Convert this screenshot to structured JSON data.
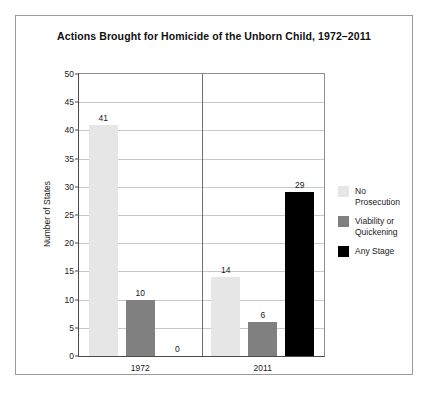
{
  "chart_data": {
    "type": "bar",
    "title": "Actions Brought for Homicide of the Unborn Child, 1972–2011",
    "xlabel": "",
    "ylabel": "Number of States",
    "categories": [
      "1972",
      "2011"
    ],
    "series": [
      {
        "name": "No Prosecution",
        "values": [
          41,
          10
        ],
        "color": "#e6e6e6"
      },
      {
        "name": "Viability or\nQuickening",
        "values": [
          10,
          6
        ],
        "color": "#808080"
      },
      {
        "name": "Any Stage",
        "values": [
          0,
          29
        ],
        "color": "#000000"
      }
    ],
    "series_values": [
      {
        "name": "No Prosecution",
        "values": [
          41,
          14
        ],
        "color": "#e6e6e6"
      },
      {
        "name": "Viability or Quickening",
        "values": [
          10,
          6
        ],
        "color": "#808080"
      },
      {
        "name": "Any Stage",
        "values": [
          0,
          29
        ],
        "color": "#000000"
      }
    ],
    "data_labels": [
      {
        "category": "1972",
        "series": "No Prosecution",
        "value": 41
      },
      {
        "category": "1972",
        "series": "Viability or Quickening",
        "value": 10
      },
      {
        "category": "1972",
        "series": "Any Stage",
        "value": 0
      },
      {
        "category": "2011",
        "series": "No Prosecution",
        "value": 14
      },
      {
        "category": "2011",
        "series": "Viability or Quickening",
        "value": 6
      },
      {
        "category": "2011",
        "series": "Any Stage",
        "value": 29
      }
    ],
    "ylim": [
      0,
      50
    ],
    "yticks": [
      0,
      5,
      10,
      15,
      20,
      25,
      30,
      35,
      40,
      45,
      50
    ],
    "ytick_labels": [
      "0",
      "5",
      "10",
      "15",
      "20",
      "25",
      "30",
      "35",
      "40",
      "45",
      "50"
    ],
    "grid": true,
    "legend_position": "right",
    "legend_entries": [
      "No Prosecution",
      "Viability or\nQuickening",
      "Any Stage"
    ]
  },
  "figure": {
    "border_color": "#9a9a9a",
    "background": "#ffffff"
  }
}
